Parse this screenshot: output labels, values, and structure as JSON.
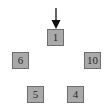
{
  "diagram": {
    "pointer": {
      "icon": "down-arrow-icon",
      "target": "1"
    },
    "nodes": [
      {
        "label": "1",
        "x": 47,
        "y": 29
      },
      {
        "label": "6",
        "x": 12,
        "y": 52
      },
      {
        "label": "10",
        "x": 84,
        "y": 52
      },
      {
        "label": "5",
        "x": 27,
        "y": 86
      },
      {
        "label": "4",
        "x": 67,
        "y": 86
      }
    ],
    "colors": {
      "node_fill": "#a9a9a9",
      "node_border": "#6f6f6f",
      "text": "#2a2a2a",
      "arrow": "#111111"
    }
  }
}
